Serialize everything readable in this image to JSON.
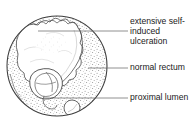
{
  "figure": {
    "name": "rectal-cross-section-diagram",
    "type": "medical-line-drawing",
    "background_color": "#ffffff",
    "ink_color": "#3a3a3a",
    "stipple_color": "#8a8a8a"
  },
  "specimen": {
    "outline_name": "rectum-outer-wall-circle",
    "center": {
      "x": 57,
      "y": 66
    },
    "radius": 50,
    "regions": [
      {
        "name": "normal-rectum-region",
        "fill": "stippled",
        "description": "stippled mucosa around periphery"
      },
      {
        "name": "ulceration-region",
        "fill": "blank",
        "description": "pale irregular lobed area occupying upper and left portion"
      },
      {
        "name": "proximal-lumen-region",
        "fill": "blank-outlined",
        "description": "rounded folded opening low-left of centre"
      },
      {
        "name": "small-satellite-lumen",
        "fill": "blank-outlined",
        "description": "small circle lower right of proximal lumen"
      }
    ]
  },
  "labels": [
    {
      "id": "ulceration",
      "name": "label-extensive-self-induced-ulceration",
      "text": "extensive self-\ninduced\nulceration",
      "leader": {
        "x1": 38,
        "y1": 31,
        "x2": 128,
        "y2": 31
      }
    },
    {
      "id": "rectum",
      "name": "label-normal-rectum",
      "text": "normal rectum",
      "leader": {
        "x1": 88,
        "y1": 68,
        "x2": 128,
        "y2": 68
      }
    },
    {
      "id": "lumen",
      "name": "label-proximal-lumen",
      "text": "proximal lumen",
      "leader": {
        "x1": 43,
        "y1": 98,
        "x2": 128,
        "y2": 98
      }
    }
  ]
}
